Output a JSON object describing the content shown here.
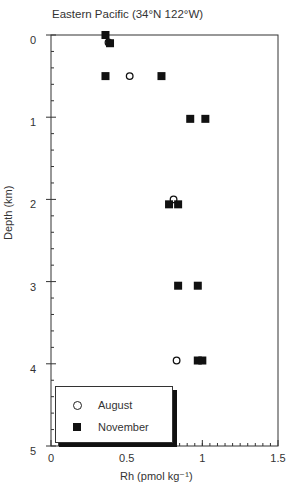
{
  "chart_data": {
    "type": "scatter",
    "title": "Eastern Pacific (34°N 122°W)",
    "xlabel": "Rh (pmol kg⁻¹)",
    "ylabel": "Depth (km)",
    "xlim": [
      0,
      1.5
    ],
    "ylim": [
      5,
      0
    ],
    "y_inverted": true,
    "x_ticks": [
      "0",
      "0.5",
      "1",
      "1.5"
    ],
    "y_ticks": [
      "0",
      "1",
      "2",
      "3",
      "4",
      "5"
    ],
    "grid": false,
    "legend_position": "lower left",
    "series": [
      {
        "name": "August",
        "marker": "open-circle",
        "points": [
          {
            "x": 0.38,
            "y": 0.09
          },
          {
            "x": 0.52,
            "y": 0.5
          },
          {
            "x": 0.81,
            "y": 2.0
          },
          {
            "x": 0.83,
            "y": 3.96
          }
        ]
      },
      {
        "name": "November",
        "marker": "filled-square",
        "points": [
          {
            "x": 0.36,
            "y": 0.0
          },
          {
            "x": 0.39,
            "y": 0.1
          },
          {
            "x": 0.36,
            "y": 0.5
          },
          {
            "x": 0.73,
            "y": 0.5
          },
          {
            "x": 0.92,
            "y": 1.02
          },
          {
            "x": 1.02,
            "y": 1.02
          },
          {
            "x": 0.78,
            "y": 2.06
          },
          {
            "x": 0.84,
            "y": 2.06
          },
          {
            "x": 0.84,
            "y": 3.05
          },
          {
            "x": 0.97,
            "y": 3.05
          },
          {
            "x": 0.97,
            "y": 3.96
          },
          {
            "x": 1.0,
            "y": 3.96
          }
        ]
      }
    ]
  },
  "legend": {
    "items": [
      {
        "label": "August",
        "marker": "open-circle"
      },
      {
        "label": "November",
        "marker": "filled-square"
      }
    ]
  },
  "colors": {
    "axis": "#333333",
    "marker": "#111111",
    "background": "#ffffff"
  }
}
